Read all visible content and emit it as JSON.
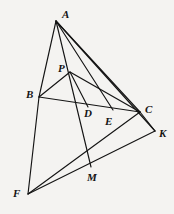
{
  "figure": {
    "canvas": {
      "width": 174,
      "height": 214
    },
    "background_color": "#f4f3f1",
    "line_color": "#141414",
    "label_color": "#141414",
    "points": [
      {
        "id": "A",
        "label": "A",
        "x": 56,
        "y": 21,
        "label_x": 62,
        "label_y": 9
      },
      {
        "id": "P",
        "label": "P",
        "x": 70,
        "y": 72,
        "label_x": 58,
        "label_y": 63
      },
      {
        "id": "B",
        "label": "B",
        "x": 39,
        "y": 97,
        "label_x": 26,
        "label_y": 89
      },
      {
        "id": "D",
        "label": "D",
        "x": 88,
        "y": 107,
        "label_x": 84,
        "label_y": 108
      },
      {
        "id": "C",
        "label": "C",
        "x": 140,
        "y": 112,
        "label_x": 145,
        "label_y": 104
      },
      {
        "id": "E",
        "label": "E",
        "x": 113,
        "y": 110,
        "label_x": 105,
        "label_y": 116
      },
      {
        "id": "K",
        "label": "K",
        "x": 155,
        "y": 131,
        "label_x": 159,
        "label_y": 128
      },
      {
        "id": "M",
        "label": "M",
        "x": 91,
        "y": 167,
        "label_x": 87,
        "label_y": 172
      },
      {
        "id": "F",
        "label": "F",
        "x": 28,
        "y": 194,
        "label_x": 13,
        "label_y": 188
      }
    ],
    "segments": [
      {
        "name": "segment-A-B",
        "from": "A",
        "to": "B"
      },
      {
        "name": "segment-A-M",
        "from": "A",
        "to": "M"
      },
      {
        "name": "segment-A-E",
        "from": "A",
        "to": "E"
      },
      {
        "name": "segment-A-C",
        "from": "A",
        "to": "C"
      },
      {
        "name": "segment-A-K",
        "from": "A",
        "to": "K"
      },
      {
        "name": "segment-P-B",
        "from": "P",
        "to": "B"
      },
      {
        "name": "segment-P-D",
        "from": "P",
        "to": "D"
      },
      {
        "name": "segment-P-C",
        "from": "P",
        "to": "C"
      },
      {
        "name": "segment-B-C",
        "from": "B",
        "to": "C"
      },
      {
        "name": "segment-B-F",
        "from": "B",
        "to": "F"
      },
      {
        "name": "segment-F-C",
        "from": "F",
        "to": "C"
      },
      {
        "name": "segment-F-K",
        "from": "F",
        "to": "K"
      },
      {
        "name": "segment-C-K",
        "from": "C",
        "to": "K"
      }
    ]
  }
}
